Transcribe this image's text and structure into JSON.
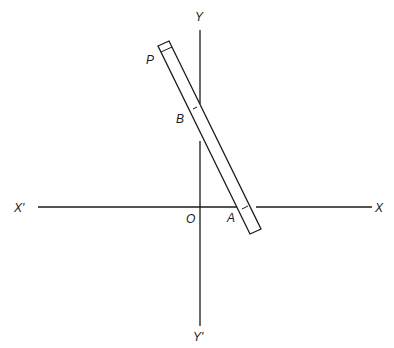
{
  "diagram": {
    "labels": {
      "y_pos": "Y",
      "y_neg": "Y'",
      "x_pos": "X",
      "x_neg": "X'",
      "origin": "O",
      "point_p": "P",
      "point_b": "B",
      "point_a": "A"
    },
    "stroke_color": "#1a1a1a",
    "background": "#ffffff"
  }
}
